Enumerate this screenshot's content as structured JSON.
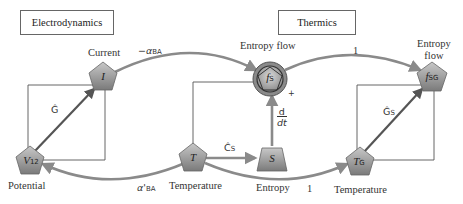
{
  "domains": {
    "left": "Electrodynamics",
    "right": "Thermics"
  },
  "nodes": {
    "current": {
      "symbol": "I",
      "label": "Current"
    },
    "potential": {
      "symbol": "V",
      "sub": "12",
      "label": "Potential"
    },
    "temperature": {
      "symbol": "T",
      "label": "Temperature"
    },
    "entropy": {
      "symbol": "S",
      "label": "Entropy"
    },
    "entropy_flow": {
      "symbol": "f",
      "sub": "S",
      "label": "Entropy flow"
    },
    "entropy_flow_sg": {
      "symbol": "f",
      "sub": "SG",
      "label_line1": "Entropy",
      "label_line2": "flow"
    },
    "temperature_g": {
      "symbol": "T",
      "sub": "G",
      "label": "Temperature"
    }
  },
  "edges": {
    "current_to_fs": {
      "coef": "−α",
      "sub": "BA"
    },
    "fs_to_fsg": {
      "coef": "1"
    },
    "temp_to_potential": {
      "coef": "α'",
      "sub": "BA"
    },
    "temp_to_tg": {
      "coef": "1"
    },
    "g_hat": {
      "coef": "Ĝ"
    },
    "gs_hat": {
      "coef": "Ĝ",
      "sub": "S"
    },
    "cs_hat": {
      "coef": "Ĉ",
      "sub": "S"
    },
    "ddt_num": "d",
    "ddt_den": "dt",
    "plus": "+"
  },
  "colors": {
    "arrow": "#8a8a8a",
    "node_fill": "#9c9c9c",
    "line": "#555555"
  }
}
